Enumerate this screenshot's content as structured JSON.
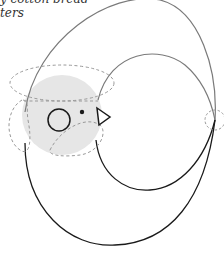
{
  "caption": {
    "line1": "y cotton bread",
    "line2": "ters"
  },
  "colors": {
    "background": "#ffffff",
    "gray_stroke": "#7a7a7a",
    "black_stroke": "#1a1a1a",
    "dashed_stroke": "#999999",
    "head_fill": "#e6e6e6"
  },
  "shapes": {
    "head_circle": {
      "cx": 62,
      "cy": 115,
      "r": 40
    },
    "eye": {
      "cx": 59,
      "cy": 120,
      "r": 11
    },
    "pupil": {
      "cx": 82,
      "cy": 112,
      "r": 2.2
    },
    "beak": {
      "points": "93,107 108,116 95,125"
    },
    "right_control_circle": {
      "cx": 215,
      "cy": 120,
      "r": 10
    }
  }
}
